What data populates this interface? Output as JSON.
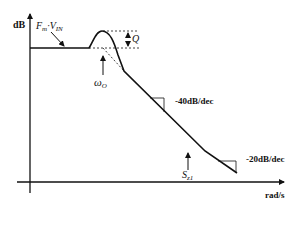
{
  "diagram": {
    "type": "bode-magnitude-plot",
    "y_axis_label": "dB",
    "x_axis_label": "rad/s",
    "dc_gain_label": {
      "main": "F",
      "sub1": "m",
      "dot": "·",
      "main2": "V",
      "sub2": "IN"
    },
    "peaking_label": "Q",
    "resonance_label": {
      "main": "ω",
      "sub": "O"
    },
    "zero_label": {
      "main": "S",
      "sub": "z1"
    },
    "slope1_label": "-40dB/dec",
    "slope2_label": "-20dB/dec",
    "colors": {
      "line": "#111111",
      "background": "#ffffff"
    }
  }
}
